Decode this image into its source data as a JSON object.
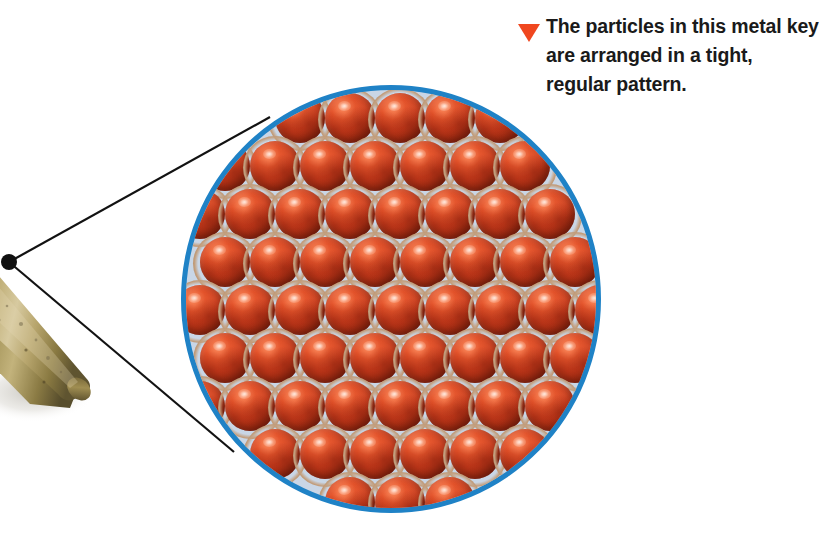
{
  "figure": {
    "kind": "science-textbook-figure",
    "background_color": "#ffffff"
  },
  "caption": {
    "marker_icon": "red-triangle-bullet-icon",
    "marker_color": "#f0471f",
    "text": "The particles in this metal key are arranged in a tight, regular pattern.",
    "text_color": "#1a1a1a"
  },
  "magnifier": {
    "name": "magnified-particle-view",
    "border_color": "#1f82c6",
    "border_width_px": 5,
    "interior_background_color": "#c9d6e6",
    "center_x": 391,
    "center_y": 299,
    "radius_x": 210,
    "radius_y": 214,
    "packing": "hexagonal-close-packed",
    "particle_color": "#d4401d",
    "particle_highlight_color": "#ffb49a",
    "particle_socket_color": "#c39f7e",
    "particle_diameter_px": 50,
    "row_spacing_px": 48,
    "column_spacing_px": 50,
    "row_count": 10,
    "description": "Tightly packed red-orange spheres in a regular repeating lattice"
  },
  "key_photo": {
    "name": "brass-key-photograph",
    "metal_color": "#9c8a4e",
    "shadow_color": "#d8d5cc",
    "description": "Photograph of the shaft of a brass key at lower left"
  },
  "leader_lines": {
    "name": "magnification-leader-lines",
    "color": "#121212",
    "width_px": 2,
    "origin_dot": {
      "x": 9,
      "y": 262,
      "radius": 8,
      "color": "#101010"
    },
    "upper_endpoint": {
      "x": 270,
      "y": 117
    },
    "lower_endpoint": {
      "x": 234,
      "y": 452
    }
  }
}
